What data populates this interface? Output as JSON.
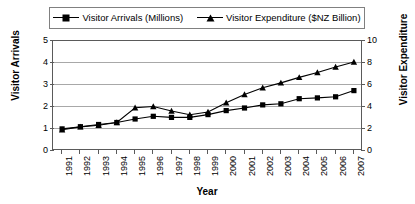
{
  "chart_data": {
    "type": "line",
    "title": "",
    "xlabel": "Year",
    "ylabel": "Visitor Arrivals",
    "y2label": "Visitor Expenditure",
    "grid": true,
    "legend_position": "top",
    "categories": [
      "1991",
      "1992",
      "1993",
      "1994",
      "1995",
      "1996",
      "1997",
      "1998",
      "1999",
      "2000",
      "2001",
      "2002",
      "2003",
      "2004",
      "2005",
      "2006",
      "2007"
    ],
    "ylim": [
      0,
      5
    ],
    "yticks": [
      0,
      1,
      2,
      3,
      4,
      5
    ],
    "y2lim": [
      0,
      10
    ],
    "y2ticks": [
      0,
      2,
      4,
      6,
      8,
      10
    ],
    "series": [
      {
        "name": "Visitor Arrivals (Millions)",
        "axis": "left",
        "marker": "square",
        "color": "#000000",
        "values": [
          0.96,
          1.06,
          1.16,
          1.25,
          1.41,
          1.53,
          1.48,
          1.48,
          1.61,
          1.79,
          1.91,
          2.05,
          2.1,
          2.33,
          2.37,
          2.42,
          2.7
        ]
      },
      {
        "name": "Visitor Expenditure ($NZ Billion)",
        "axis": "right",
        "marker": "triangle",
        "color": "#000000",
        "values": [
          1.85,
          2.1,
          2.25,
          2.5,
          3.85,
          3.95,
          3.55,
          3.2,
          3.45,
          4.3,
          5.05,
          5.65,
          6.1,
          6.6,
          7.05,
          7.55,
          8.0
        ]
      }
    ]
  },
  "legend": {
    "entries": [
      {
        "label": "Visitor Arrivals (Millions)",
        "marker": "square-marker-icon"
      },
      {
        "label": "Visitor Expenditure ($NZ Billion)",
        "marker": "triangle-marker-icon"
      }
    ]
  },
  "axes": {
    "y_left_title": "Visitor Arrivals",
    "y_right_title": "Visitor Expenditure",
    "x_title": "Year"
  }
}
